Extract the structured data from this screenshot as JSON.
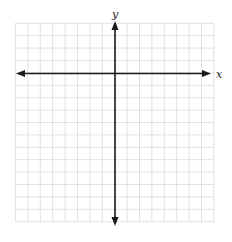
{
  "graph": {
    "x_label": "x",
    "y_label": "y",
    "grid": {
      "columns": 16,
      "rows": 16,
      "left": 15.5,
      "top": 23.3,
      "cell": 12.4,
      "color": "#d9d9d9"
    },
    "origin": {
      "x": 115,
      "y": 73.5
    },
    "axis_color": "#1a1a1a",
    "x_axis": {
      "from": 16,
      "to": 211
    },
    "y_axis": {
      "from": 21,
      "to": 226
    }
  }
}
